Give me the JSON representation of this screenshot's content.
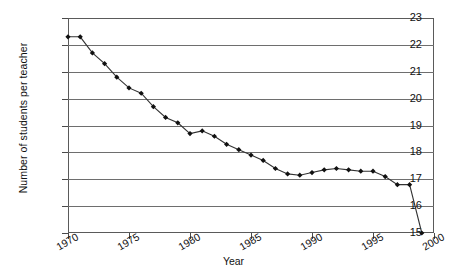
{
  "chart_data": {
    "type": "line",
    "title": "",
    "xlabel": "Year",
    "ylabel": "Number of students per teacher",
    "xlim": [
      1970,
      2000
    ],
    "ylim": [
      15,
      23
    ],
    "grid": true,
    "legend": "none",
    "marker": "filled-diamond",
    "line_color": "#333333",
    "y_ticks": [
      23,
      22,
      21,
      20,
      19,
      18,
      17,
      16,
      15
    ],
    "x_ticks": [
      1970,
      1975,
      1980,
      1985,
      1990,
      1995,
      2000
    ],
    "x": [
      1970,
      1971,
      1972,
      1973,
      1974,
      1975,
      1976,
      1977,
      1978,
      1979,
      1980,
      1981,
      1982,
      1983,
      1984,
      1985,
      1986,
      1987,
      1988,
      1989,
      1990,
      1991,
      1992,
      1993,
      1994,
      1995,
      1996,
      1997,
      1998,
      1999
    ],
    "values": [
      22.3,
      22.3,
      21.7,
      21.3,
      20.8,
      20.4,
      20.2,
      19.7,
      19.3,
      19.1,
      18.7,
      18.8,
      18.6,
      18.3,
      18.1,
      17.9,
      17.7,
      17.4,
      17.2,
      17.15,
      17.25,
      17.35,
      17.4,
      17.35,
      17.3,
      17.3,
      17.1,
      16.8,
      16.8,
      15.0
    ],
    "series": [
      {
        "name": "Number of students per teacher",
        "values": [
          22.3,
          22.3,
          21.7,
          21.3,
          20.8,
          20.4,
          20.2,
          19.7,
          19.3,
          19.1,
          18.7,
          18.8,
          18.6,
          18.3,
          18.1,
          17.9,
          17.7,
          17.4,
          17.2,
          17.15,
          17.25,
          17.35,
          17.4,
          17.35,
          17.3,
          17.3,
          17.1,
          16.8,
          16.8,
          15.0
        ]
      }
    ]
  }
}
